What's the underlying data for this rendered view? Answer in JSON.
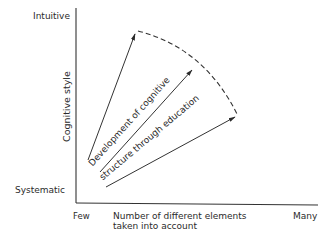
{
  "diagram": {
    "type": "conceptual-vector-diagram",
    "y_axis": {
      "title": "Cognitive style",
      "top_label": "Intuitive",
      "bottom_label": "Systematic"
    },
    "x_axis": {
      "left_label": "Few",
      "title_line1": "Number of different elements",
      "title_line2": "taken into account",
      "right_label": "Many"
    },
    "annotation": {
      "line1": "Development of cognitive",
      "line2": "structure through education"
    },
    "arrows": [
      {
        "name": "upper-arrow",
        "from": [
          88,
          160
        ],
        "to": [
          136,
          32
        ]
      },
      {
        "name": "middle-arrow",
        "from": [
          100,
          172
        ],
        "to": [
          193,
          68
        ]
      },
      {
        "name": "lower-arrow",
        "from": [
          106,
          187
        ],
        "to": [
          237,
          116
        ]
      }
    ],
    "frontier": {
      "style": "dashed-arc",
      "from": [
        136,
        32
      ],
      "to": [
        237,
        116
      ]
    },
    "colors": {
      "ink": "#2b2b2b",
      "background": "#ffffff"
    }
  }
}
